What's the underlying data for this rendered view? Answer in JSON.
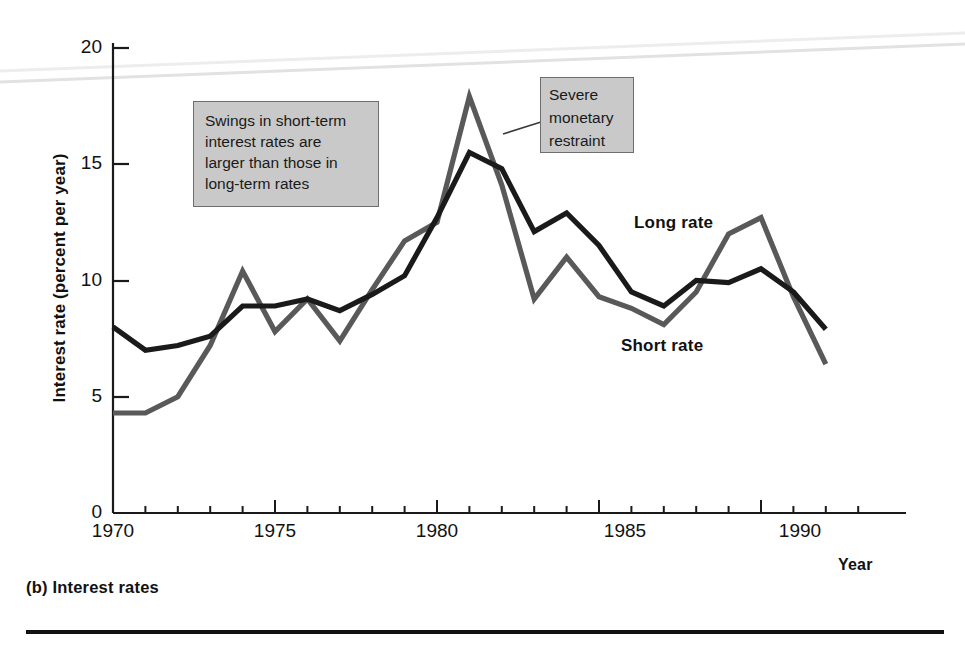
{
  "figure": {
    "caption": "(b) Interest rates",
    "ylabel": "Interest rate (percent per year)",
    "xlabel": "Year"
  },
  "annotations": {
    "swings": {
      "line1": "Swings in short-term",
      "line2": "interest rates are",
      "line3": "larger than those in",
      "line4": "long-term rates"
    },
    "severe": {
      "line1": "Severe",
      "line2": "monetary",
      "line3": "restraint"
    }
  },
  "series_labels": {
    "long": "Long rate",
    "short": "Short rate"
  },
  "axis": {
    "y_ticks": [
      "0",
      "5",
      "10",
      "15",
      "20"
    ],
    "x_ticks": [
      "1970",
      "1975",
      "1980",
      "1985",
      "1990"
    ]
  },
  "colors": {
    "long_rate": "#1a1a1a",
    "short_rate": "#595959",
    "annotation_fill": "#c9c9c9",
    "annotation_border": "#6e6e6e",
    "axis": "#1a1a1a"
  },
  "chart_data": {
    "type": "line",
    "title": "(b) Interest rates",
    "xlabel": "Year",
    "ylabel": "Interest rate (percent per year)",
    "xlim": [
      1970,
      1993
    ],
    "ylim": [
      0,
      21
    ],
    "yticks": [
      0,
      5,
      10,
      15,
      20
    ],
    "xticks": [
      1970,
      1975,
      1980,
      1985,
      1990
    ],
    "grid": false,
    "legend": "inline-labels",
    "x": [
      1970,
      1971,
      1972,
      1973,
      1974,
      1975,
      1976,
      1977,
      1978,
      1979,
      1980,
      1981,
      1982,
      1983,
      1984,
      1985,
      1986,
      1987,
      1988,
      1989,
      1990,
      1991,
      1992
    ],
    "series": [
      {
        "name": "Long rate",
        "color": "#1a1a1a",
        "values": [
          8.0,
          7.0,
          7.2,
          7.6,
          8.9,
          8.9,
          9.2,
          8.7,
          9.4,
          10.2,
          12.7,
          15.5,
          14.8,
          12.1,
          12.9,
          11.5,
          9.5,
          8.9,
          10.0,
          9.9,
          10.5,
          9.5,
          7.9
        ]
      },
      {
        "name": "Short rate",
        "color": "#595959",
        "values": [
          4.3,
          4.3,
          5.0,
          7.2,
          10.4,
          7.8,
          9.2,
          7.4,
          9.6,
          11.7,
          12.5,
          17.9,
          14.1,
          9.2,
          11.0,
          9.3,
          8.8,
          8.1,
          9.5,
          12.0,
          12.7,
          9.3,
          6.4
        ]
      }
    ],
    "annotations": [
      {
        "text": "Swings in short-term interest rates are larger than those in long-term rates",
        "x": 1972.5,
        "y": 18.5
      },
      {
        "text": "Severe monetary restraint",
        "x": 1983.0,
        "y": 19.5,
        "points_to": {
          "x": 1981.4,
          "y": 16.3
        }
      }
    ]
  }
}
